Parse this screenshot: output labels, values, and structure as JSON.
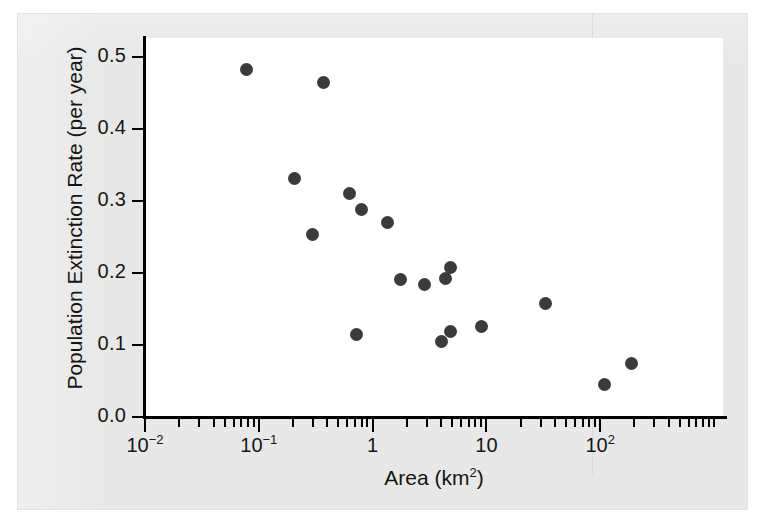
{
  "figure": {
    "background_color": "#e8e8e8",
    "plot_background_color": "#ffffff",
    "marker_color": "#3b3b3b",
    "axis_color": "#000000"
  },
  "chart_data": {
    "type": "scatter",
    "title": "",
    "xlabel": "Area (km2)",
    "xlabel_base": "Area (km",
    "xlabel_sup": "2",
    "xlabel_close": ")",
    "ylabel": "Population Extinction Rate (per year)",
    "xscale": "log",
    "yscale": "linear",
    "xlim": [
      0.01,
      1000
    ],
    "ylim": [
      0.0,
      0.52
    ],
    "grid": false,
    "legend": "none",
    "series_name": "bighorn sheep populations",
    "x_tick_labels": [
      {
        "value": 0.01,
        "base": "10",
        "exp": "-2",
        "text": "10-2"
      },
      {
        "value": 0.1,
        "base": "10",
        "exp": "-1",
        "text": "10-1"
      },
      {
        "value": 1,
        "base": "1",
        "exp": "",
        "text": "1"
      },
      {
        "value": 10,
        "base": "10",
        "exp": "",
        "text": "10"
      },
      {
        "value": 100,
        "base": "10",
        "exp": "2",
        "text": "102"
      }
    ],
    "y_tick_labels": [
      "0.5",
      "0.4",
      "0.3",
      "0.2",
      "0.1",
      "0.0"
    ],
    "y_tick_values": [
      0.5,
      0.4,
      0.3,
      0.2,
      0.1,
      0.0
    ],
    "points": [
      {
        "x": 0.078,
        "y": 0.482
      },
      {
        "x": 0.37,
        "y": 0.465
      },
      {
        "x": 0.205,
        "y": 0.331
      },
      {
        "x": 0.63,
        "y": 0.31
      },
      {
        "x": 0.8,
        "y": 0.288
      },
      {
        "x": 1.35,
        "y": 0.27
      },
      {
        "x": 0.295,
        "y": 0.253
      },
      {
        "x": 4.85,
        "y": 0.208
      },
      {
        "x": 1.75,
        "y": 0.191
      },
      {
        "x": 4.4,
        "y": 0.193
      },
      {
        "x": 2.85,
        "y": 0.184
      },
      {
        "x": 33.0,
        "y": 0.158
      },
      {
        "x": 9.0,
        "y": 0.126
      },
      {
        "x": 4.8,
        "y": 0.119
      },
      {
        "x": 0.72,
        "y": 0.115
      },
      {
        "x": 4.05,
        "y": 0.105
      },
      {
        "x": 190.0,
        "y": 0.074
      },
      {
        "x": 108.0,
        "y": 0.045
      }
    ]
  }
}
